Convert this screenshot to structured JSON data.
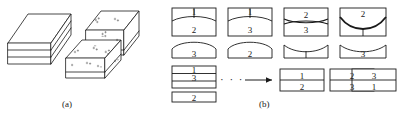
{
  "figure": {
    "caption_a": "(a)",
    "caption_b": "(b)",
    "stroke_color": "#1a1a1a",
    "fill_color": "#ffffff"
  },
  "panel_a": {
    "label": "(a)",
    "blocks": [
      {
        "name": "intact-laminate-block",
        "layers": 3,
        "speckled": false
      },
      {
        "name": "delaminated-upper-block",
        "layers": 2,
        "speckled": true
      },
      {
        "name": "delaminated-lower-block",
        "layers": 2,
        "speckled": true
      }
    ]
  },
  "panel_b": {
    "label": "(b)",
    "top_row": [
      {
        "name": "step-1",
        "upper": {
          "top": "1",
          "bottom": "2",
          "divider": "arc-down"
        },
        "lower": {
          "value": "3",
          "top_edge": "dome"
        }
      },
      {
        "name": "step-2",
        "upper": {
          "top": "1",
          "bottom": "3",
          "divider": "arc-down"
        },
        "lower": {
          "value": "2",
          "top_edge": "dome"
        }
      },
      {
        "name": "step-3",
        "upper": {
          "top": "2",
          "bottom": "3",
          "divider": "pinch"
        },
        "lower": {
          "value": "",
          "top_edge": "concave"
        }
      },
      {
        "name": "step-4",
        "upper": {
          "top": "2",
          "bottom": "",
          "divider": "deep-sag"
        },
        "lower": {
          "value": "3",
          "top_edge": "concave"
        }
      }
    ],
    "bottom_row": {
      "stack": {
        "name": "stacked-plies",
        "rows": [
          "1",
          "3"
        ],
        "detached": "2"
      },
      "ellipsis": "· · ·",
      "arrow": "→",
      "results": [
        {
          "name": "result-1",
          "top": "1",
          "bottom": "2"
        },
        {
          "name": "result-2",
          "top": "2",
          "bottom": "3"
        },
        {
          "name": "result-3",
          "top": "3",
          "bottom": "1"
        }
      ]
    }
  }
}
